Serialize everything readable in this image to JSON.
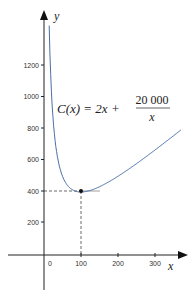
{
  "chart_data": {
    "type": "line",
    "title": "",
    "xlabel": "x",
    "ylabel": "y",
    "x_ticks": [
      "0",
      "100",
      "200",
      "300"
    ],
    "y_ticks": [
      "200",
      "400",
      "600",
      "800",
      "1000",
      "1200"
    ],
    "xlim": [
      -60,
      360
    ],
    "ylim": [
      -180,
      1400
    ],
    "grid": false,
    "annotation": {
      "formula_lhs": "C(x) = 2x +",
      "numerator": "20 000",
      "denominator": "x"
    },
    "minimum_point": {
      "x": 100,
      "y": 400
    },
    "series": [
      {
        "name": "C(x) = 2x + 20000/x",
        "x": [
          14,
          20,
          30,
          40,
          50,
          60,
          70,
          80,
          100,
          120,
          150,
          200,
          250,
          300,
          350
        ],
        "values": [
          1456.6,
          1040,
          726.7,
          580,
          500,
          453.3,
          425.7,
          410,
          400,
          406.7,
          433.3,
          500,
          580,
          666.7,
          757.1
        ]
      }
    ],
    "color": "#4a6fa5"
  }
}
